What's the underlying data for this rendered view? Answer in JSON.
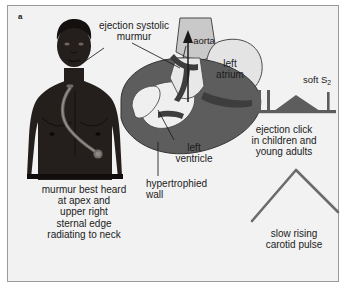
{
  "figure": {
    "panel_letter": "a",
    "topic": "aortic stenosis clinical signs",
    "background_color": "#f2f2f2",
    "border_color": "#9a9a9a",
    "ink_color": "#1b1b1b"
  },
  "body_figure": {
    "name": "patient-torso",
    "description": "dark-skinned male torso with stethoscope across chest",
    "skin_color": "#241f1d",
    "stethoscope_color": "#6f6a66"
  },
  "heart": {
    "name": "heart-cross-section",
    "myocardium_color": "#5d5d5d",
    "chamber_color": "#efefef",
    "vessel_color": "#c9c9c9",
    "labels": {
      "aorta": "aorta",
      "left_atrium": "left\natrium",
      "left_atrium_line1": "left",
      "left_atrium_line2": "atrium",
      "left_ventricle_line1": "left",
      "left_ventricle_line2": "ventricle",
      "hypertrophied_line1": "hypertrophied",
      "hypertrophied_line2": "wall"
    }
  },
  "annotations": {
    "murmur_line1": "ejection systolic",
    "murmur_line2": "murmur",
    "best_heard_line1": "murmur best heard",
    "best_heard_line2": "at apex and",
    "best_heard_line3": "upper right",
    "best_heard_line4": "sternal edge",
    "best_heard_line5": "radiating to neck"
  },
  "phonocardiogram": {
    "name": "phonocardiogram-trace",
    "soft_s2_label_prefix": "soft S",
    "soft_s2_label_subscript": "2",
    "caption_line1": "ejection click",
    "caption_line2": "in children and",
    "caption_line3": "young adults",
    "trace_color": "#5d5d5d",
    "events": [
      {
        "name": "first-heart-sound",
        "type": "spike",
        "x": 14,
        "amplitude": 22
      },
      {
        "name": "ejection-click",
        "type": "spike",
        "x": 24,
        "amplitude": 22
      },
      {
        "name": "ejection-systolic-murmur",
        "type": "diamond",
        "x_start": 30,
        "x_peak": 58,
        "x_end": 86,
        "amplitude": 16
      },
      {
        "name": "soft-second-heart-sound",
        "type": "spike",
        "x": 92,
        "amplitude": 20
      }
    ]
  },
  "carotid_pulse": {
    "name": "carotid-pulse-trace",
    "caption_line1": "slow rising",
    "caption_line2": "carotid pulse",
    "trace_color": "#6b6b6b",
    "shape": "slow-rising-plateau-peak",
    "points": [
      [
        0,
        56
      ],
      [
        54,
        6
      ],
      [
        96,
        46
      ]
    ]
  }
}
